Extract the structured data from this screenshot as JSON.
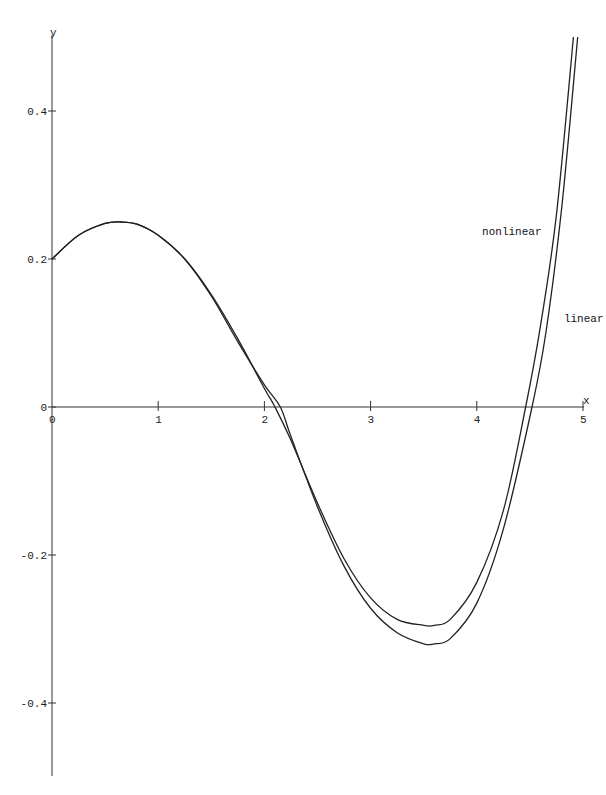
{
  "chart_data": {
    "type": "line",
    "title": "",
    "xlabel": "x",
    "ylabel": "y",
    "xlim": [
      0,
      5
    ],
    "ylim": [
      -0.5,
      0.5
    ],
    "grid": false,
    "legend_position": "inline labels near right end of curves",
    "x_ticks": [
      0,
      1,
      2,
      3,
      4,
      5
    ],
    "x_tick_labels": [
      "0",
      "1",
      "2",
      "3",
      "4",
      "5"
    ],
    "y_ticks": [
      0.4,
      0.2,
      0,
      -0.2,
      -0.4
    ],
    "y_tick_labels": [
      "0.4",
      "0.2",
      "0",
      "-0.2",
      "-0.4"
    ],
    "series": [
      {
        "name": "nonlinear",
        "x": [
          0,
          0.25,
          0.5,
          0.65,
          0.8,
          1.0,
          1.25,
          1.5,
          1.75,
          2.0,
          2.1,
          2.25,
          2.5,
          2.75,
          3.0,
          3.25,
          3.5,
          3.6,
          3.75,
          4.0,
          4.25,
          4.46,
          4.6,
          4.75,
          4.91
        ],
        "y": [
          0.2,
          0.232,
          0.248,
          0.25,
          0.247,
          0.232,
          0.2,
          0.152,
          0.092,
          0.025,
          0.0,
          -0.045,
          -0.13,
          -0.205,
          -0.258,
          -0.287,
          -0.295,
          -0.295,
          -0.287,
          -0.237,
          -0.14,
          0.0,
          0.11,
          0.26,
          0.5
        ]
      },
      {
        "name": "linear",
        "x": [
          0,
          0.25,
          0.5,
          0.65,
          0.8,
          1.0,
          1.25,
          1.5,
          1.75,
          2.0,
          2.15,
          2.25,
          2.5,
          2.75,
          3.0,
          3.25,
          3.5,
          3.6,
          3.75,
          4.0,
          4.25,
          4.52,
          4.65,
          4.8,
          4.95
        ],
        "y": [
          0.2,
          0.232,
          0.248,
          0.25,
          0.247,
          0.232,
          0.2,
          0.15,
          0.088,
          0.03,
          0.0,
          -0.04,
          -0.135,
          -0.215,
          -0.272,
          -0.305,
          -0.32,
          -0.32,
          -0.313,
          -0.265,
          -0.165,
          0.0,
          0.1,
          0.27,
          0.5
        ]
      }
    ],
    "annotations": [
      {
        "text": "nonlinear",
        "x": 4.05,
        "y": 0.232
      },
      {
        "text": "linear",
        "x": 4.82,
        "y": 0.115
      }
    ]
  }
}
